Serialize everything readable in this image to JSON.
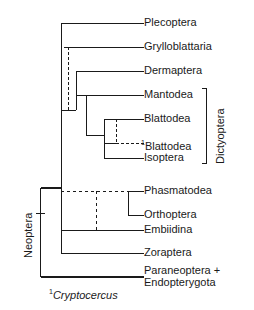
{
  "figure": {
    "type": "cladogram",
    "title": "",
    "footnote_marker": "1",
    "footnote_text": "Cryptocercus",
    "line_color": "#1a1a1a"
  },
  "tips": [
    {
      "label": "Plecoptera",
      "y": 23,
      "branch_x": 61,
      "dashed": false,
      "superscript": ""
    },
    {
      "label": "Grylloblattaria",
      "y": 47,
      "branch_x": 68,
      "dashed": false,
      "superscript": ""
    },
    {
      "label": "Dermaptera",
      "y": 71,
      "branch_x": 76,
      "dashed": false,
      "superscript": ""
    },
    {
      "label": "Mantodea",
      "y": 95,
      "branch_x": 86,
      "dashed": false,
      "superscript": ""
    },
    {
      "label": "Blattodea",
      "y": 119,
      "branch_x": 104,
      "dashed": false,
      "superscript": ""
    },
    {
      "label": "Blattodea",
      "y": 143,
      "branch_x": 116,
      "dashed": true,
      "superscript": "1"
    },
    {
      "label": "Isoptera",
      "y": 158,
      "branch_x": 104,
      "dashed": false,
      "superscript": ""
    },
    {
      "label": "Phasmatodea",
      "y": 191,
      "branch_x": 128,
      "dashed": false,
      "superscript": ""
    },
    {
      "label": "Orthoptera",
      "y": 215,
      "branch_x": 128,
      "dashed": false,
      "superscript": ""
    },
    {
      "label": "Embiidina",
      "y": 230,
      "branch_x": 61,
      "dashed": false,
      "superscript": ""
    },
    {
      "label": "Zoraptera",
      "y": 253,
      "branch_x": 61,
      "dashed": false,
      "superscript": ""
    }
  ],
  "outgroup_tip": {
    "label_line1": "Paraneoptera +",
    "label_line2": "Endopterygota",
    "y": 277,
    "branch_x": 40
  },
  "brackets": {
    "dictyoptera": {
      "label": "Dictyoptera",
      "x": 206,
      "y_top": 88,
      "y_bottom": 164
    }
  },
  "clade_labels": {
    "neoptera": {
      "label": "Neoptera",
      "x": 40,
      "y_tick": 213
    }
  },
  "geometry": {
    "tip_label_x": 144,
    "root_x": 40,
    "root_y_top": 188,
    "root_y_bottom": 277,
    "main_spine_x": 61,
    "main_spine_y_top": 23,
    "main_spine_y_bottom": 253,
    "dashed_spine_x": 68,
    "dashed_spine_y_top": 47,
    "dashed_spine_y_bottom": 110,
    "dermaptera_node_x": 76,
    "mantodea_node_x": 86,
    "blattodea_node_x": 104,
    "cryptocercus_node_x": 116,
    "phasmatodea_node_x": 128,
    "dashed_cross_y": 191,
    "dashed_cross_x_start": 61,
    "dashed_cross_x_end": 128,
    "dashed_drop_x": 96,
    "dashed_drop_y_end": 230
  }
}
